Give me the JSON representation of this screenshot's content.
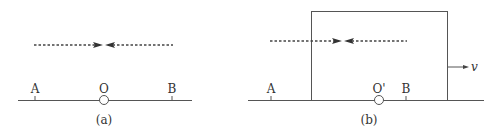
{
  "figure": {
    "panels": [
      {
        "caption": "(a)",
        "points": {
          "left": "A",
          "center": "O",
          "right": "B"
        }
      },
      {
        "caption": "(b)",
        "points": {
          "left": "A",
          "center": "O'",
          "right": "B"
        },
        "velocity_label": "v"
      }
    ],
    "colors": {
      "line": "#555555",
      "arrow": "#333333",
      "text": "#333333"
    }
  }
}
